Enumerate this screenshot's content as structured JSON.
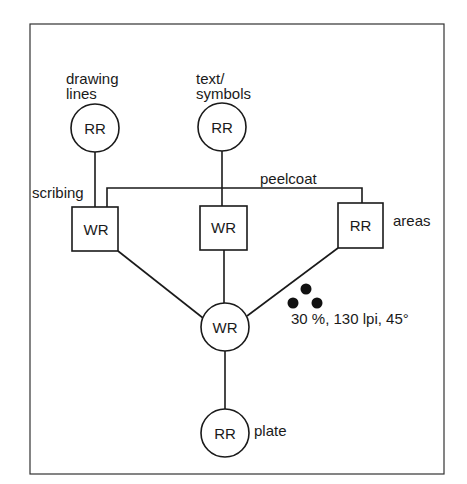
{
  "diagram": {
    "nodes": {
      "drawing_lines": {
        "type": "circle",
        "text": "RR",
        "caption_line1": "drawing",
        "caption_line2": "lines"
      },
      "text_symbols": {
        "type": "circle",
        "text": "RR",
        "caption_line1": "text/",
        "caption_line2": "symbols"
      },
      "scribing": {
        "type": "box",
        "text": "WR",
        "caption": "scribing"
      },
      "middle": {
        "type": "box",
        "text": "WR"
      },
      "areas": {
        "type": "box",
        "text": "RR",
        "caption": "areas"
      },
      "combined": {
        "type": "circle",
        "text": "WR"
      },
      "plate": {
        "type": "circle",
        "text": "RR",
        "caption": "plate"
      }
    },
    "connector_labels": {
      "peelcoat": "peelcoat"
    },
    "screen_annotation": "30 %, 130 lpi, 45°",
    "colors": {
      "stroke": "#1a1a1a",
      "background": "#ffffff"
    }
  }
}
